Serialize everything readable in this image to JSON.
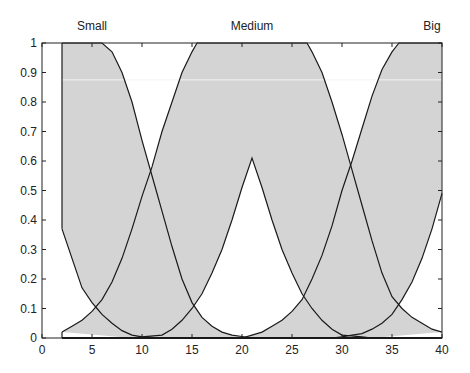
{
  "chart_data": {
    "type": "area",
    "title": "",
    "xlabel": "",
    "ylabel": "",
    "xlim": [
      0,
      40
    ],
    "ylim": [
      0,
      1
    ],
    "grid": false,
    "x_ticks": [
      0,
      5,
      10,
      15,
      20,
      25,
      30,
      35,
      40
    ],
    "y_ticks": [
      0,
      0.1,
      0.2,
      0.3,
      0.4,
      0.5,
      0.6,
      0.7,
      0.8,
      0.9,
      1
    ],
    "y_tick_labels": [
      "0",
      "0.1",
      "0.2",
      "0.3",
      "0.4",
      "0.5",
      "0.6",
      "0.7",
      "0.8",
      "0.9",
      "1"
    ],
    "fill_color": "#d4d4d4",
    "line_color": "#1a1a1a",
    "series": [
      {
        "name": "Small",
        "label_x": 5,
        "upper": [
          [
            2,
            1
          ],
          [
            6,
            1
          ],
          [
            7,
            0.97
          ],
          [
            8,
            0.9
          ],
          [
            9,
            0.8
          ],
          [
            10,
            0.67
          ],
          [
            11,
            0.55
          ],
          [
            12,
            0.43
          ],
          [
            13,
            0.31
          ],
          [
            14,
            0.2
          ],
          [
            15,
            0.12
          ],
          [
            16,
            0.07
          ],
          [
            17,
            0.04
          ],
          [
            18,
            0.02
          ],
          [
            19,
            0.01
          ],
          [
            20,
            0.005
          ],
          [
            21,
            0
          ]
        ],
        "lower": [
          [
            2,
            0.37
          ],
          [
            3,
            0.27
          ],
          [
            4,
            0.17
          ],
          [
            5,
            0.12
          ],
          [
            5.5,
            0.1
          ],
          [
            6,
            0.08
          ],
          [
            7,
            0.05
          ],
          [
            8,
            0.025
          ],
          [
            9,
            0.01
          ],
          [
            10,
            0.004
          ],
          [
            12,
            0
          ]
        ]
      },
      {
        "name": "Medium",
        "label_x": 21,
        "upper": [
          [
            2,
            0.02
          ],
          [
            3,
            0.04
          ],
          [
            4,
            0.06
          ],
          [
            5,
            0.09
          ],
          [
            6,
            0.13
          ],
          [
            7,
            0.19
          ],
          [
            8,
            0.27
          ],
          [
            9,
            0.37
          ],
          [
            10,
            0.48
          ],
          [
            11,
            0.58
          ],
          [
            12,
            0.7
          ],
          [
            13,
            0.8
          ],
          [
            14,
            0.9
          ],
          [
            15,
            0.97
          ],
          [
            15.5,
            1
          ],
          [
            26.5,
            1
          ],
          [
            27,
            0.97
          ],
          [
            28,
            0.9
          ],
          [
            29,
            0.8
          ],
          [
            30,
            0.69
          ],
          [
            31,
            0.57
          ],
          [
            32,
            0.45
          ],
          [
            33,
            0.33
          ],
          [
            34,
            0.22
          ],
          [
            35,
            0.14
          ],
          [
            36,
            0.1
          ],
          [
            37,
            0.07
          ],
          [
            38,
            0.05
          ],
          [
            39,
            0.03
          ],
          [
            40,
            0.02
          ]
        ],
        "lower": [
          [
            9,
            0
          ],
          [
            10,
            0.004
          ],
          [
            12,
            0.01
          ],
          [
            13,
            0.03
          ],
          [
            14,
            0.06
          ],
          [
            15,
            0.1
          ],
          [
            16,
            0.15
          ],
          [
            17,
            0.22
          ],
          [
            18,
            0.3
          ],
          [
            19,
            0.4
          ],
          [
            20,
            0.51
          ],
          [
            21,
            0.61
          ],
          [
            22,
            0.51
          ],
          [
            23,
            0.4
          ],
          [
            24,
            0.3
          ],
          [
            25,
            0.22
          ],
          [
            26,
            0.15
          ],
          [
            27,
            0.1
          ],
          [
            28,
            0.06
          ],
          [
            29,
            0.03
          ],
          [
            30,
            0.01
          ],
          [
            32,
            0.004
          ],
          [
            33,
            0
          ]
        ]
      },
      {
        "name": "Big",
        "label_x": 39,
        "upper": [
          [
            20,
            0
          ],
          [
            21,
            0.01
          ],
          [
            22,
            0.02
          ],
          [
            23,
            0.04
          ],
          [
            24,
            0.06
          ],
          [
            25,
            0.09
          ],
          [
            26,
            0.13
          ],
          [
            27,
            0.2
          ],
          [
            28,
            0.28
          ],
          [
            29,
            0.38
          ],
          [
            30,
            0.5
          ],
          [
            31,
            0.6
          ],
          [
            32,
            0.71
          ],
          [
            33,
            0.82
          ],
          [
            34,
            0.91
          ],
          [
            35,
            0.97
          ],
          [
            35.7,
            1
          ],
          [
            40,
            1
          ]
        ],
        "lower": [
          [
            29,
            0
          ],
          [
            30,
            0.004
          ],
          [
            31,
            0.01
          ],
          [
            32,
            0.015
          ],
          [
            33,
            0.03
          ],
          [
            34,
            0.05
          ],
          [
            35,
            0.08
          ],
          [
            36,
            0.13
          ],
          [
            37,
            0.19
          ],
          [
            38,
            0.27
          ],
          [
            39,
            0.37
          ],
          [
            40,
            0.49
          ]
        ]
      }
    ]
  }
}
